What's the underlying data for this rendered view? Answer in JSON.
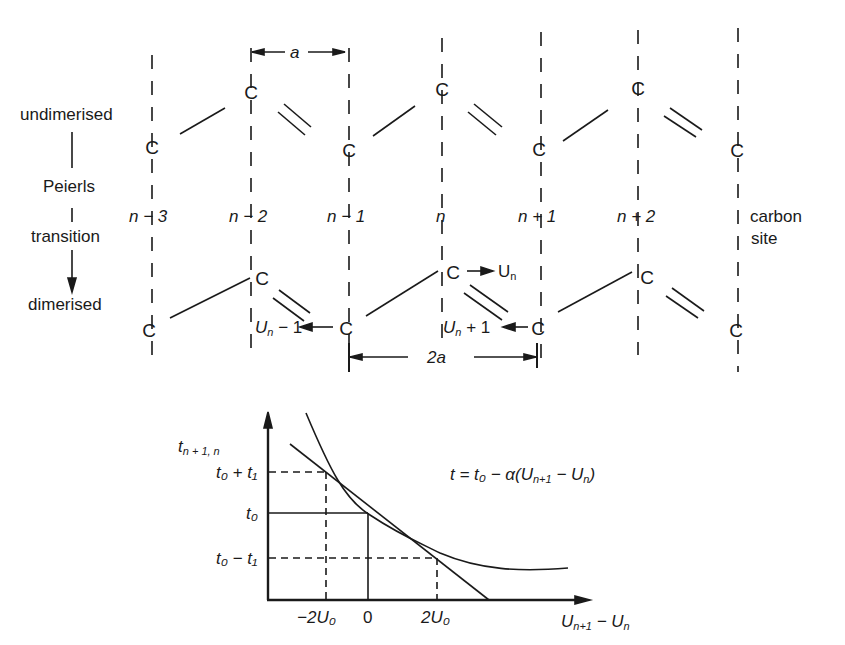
{
  "left_labels": {
    "undimerised": "undimerised",
    "peierls": "Peierls",
    "transition": "transition",
    "dimerised": "dimerised"
  },
  "site_labels": [
    "n − 3",
    "n − 2",
    "n − 1",
    "n",
    "n + 1",
    "n + 2"
  ],
  "carbon_site": [
    "carbon",
    "site"
  ],
  "atom_symbol": "C",
  "spacing": {
    "a": "a",
    "two_a": "2a"
  },
  "displacements": {
    "un_minus_1_base": "U",
    "un_minus_1_sub": "n",
    "un_minus_1_tail": " − 1",
    "un": "U",
    "un_sub": "n",
    "un_plus_1_base": "U",
    "un_plus_1_sub": "n",
    "un_plus_1_tail": " + 1"
  },
  "graph": {
    "y_axis_label": "t",
    "y_axis_sub": "n + 1, n",
    "y_ticks": [
      "t₀ + t₁",
      "t₀",
      "t₀ − t₁"
    ],
    "x_ticks": [
      "−2U₀",
      "0",
      "2U₀"
    ],
    "x_axis_label": "U",
    "x_axis_sub1": "n+1",
    "x_axis_tail": " − U",
    "x_axis_sub2": "n",
    "equation": "t = t₀ − α(U",
    "equation_sub1": "n+1",
    "equation_mid": " − U",
    "equation_sub2": "n",
    "equation_end": ")"
  }
}
